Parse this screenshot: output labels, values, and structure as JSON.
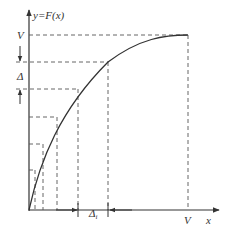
{
  "diagram": {
    "type": "cumulative-distribution-inverse-sampling",
    "y_axis_label": "y=F(x)",
    "x_axis_label": "x",
    "y_max_label": "V",
    "x_max_label": "V",
    "delta_label": "Δ",
    "delta_i_label": "Δ",
    "delta_i_subscript": "i",
    "colors": {
      "line": "#444444",
      "dash": "#555555",
      "background": "#ffffff"
    },
    "levels_y_px": [
      35,
      62,
      89,
      117,
      144,
      170
    ],
    "levels_x_px": [
      188,
      108,
      78,
      57,
      43,
      35
    ]
  }
}
